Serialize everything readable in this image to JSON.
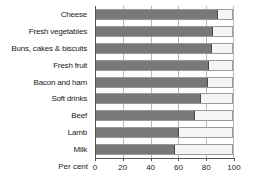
{
  "chart_data": {
    "type": "bar",
    "orientation": "horizontal",
    "title": "",
    "subtitle": "",
    "xlabel": "Per cent",
    "ylabel": "",
    "xlim": [
      0,
      100
    ],
    "xticks": [
      0,
      20,
      40,
      60,
      80,
      100
    ],
    "xtick_labels": [
      "0",
      "20",
      "40",
      "60",
      "80",
      "100"
    ],
    "grid": true,
    "grid_axis": "x",
    "legend": false,
    "legend_position": "none",
    "stacked": true,
    "categories": [
      "Cheese",
      "Fresh vegetables",
      "Buns, cakes & biscuits",
      "Fresh fruit",
      "Bacon and ham",
      "Soft drinks",
      "Beef",
      "Lamb",
      "Milk"
    ],
    "series": [
      {
        "name": "Value",
        "color": "#787878",
        "values": [
          90,
          86,
          85,
          83,
          82,
          77,
          73,
          61,
          58
        ]
      },
      {
        "name": "Remainder",
        "color": "#f5f5f5",
        "values": [
          10,
          14,
          15,
          17,
          18,
          23,
          27,
          39,
          42
        ]
      }
    ],
    "values": [
      90,
      86,
      85,
      83,
      82,
      77,
      73,
      61,
      58
    ]
  },
  "axis": {
    "x_title": "Per cent",
    "ticks": [
      {
        "value": 0,
        "label": "0"
      },
      {
        "value": 20,
        "label": "20"
      },
      {
        "value": 40,
        "label": "40"
      },
      {
        "value": 60,
        "label": "60"
      },
      {
        "value": 80,
        "label": "80"
      },
      {
        "value": 100,
        "label": "100"
      }
    ]
  },
  "style": {
    "bar_color": "#787878",
    "remainder_color": "#f5f5f5",
    "grid_color": "#b8b8b8",
    "axis_color": "#555555",
    "text_color": "#1a1a1a",
    "background": "#ffffff"
  }
}
